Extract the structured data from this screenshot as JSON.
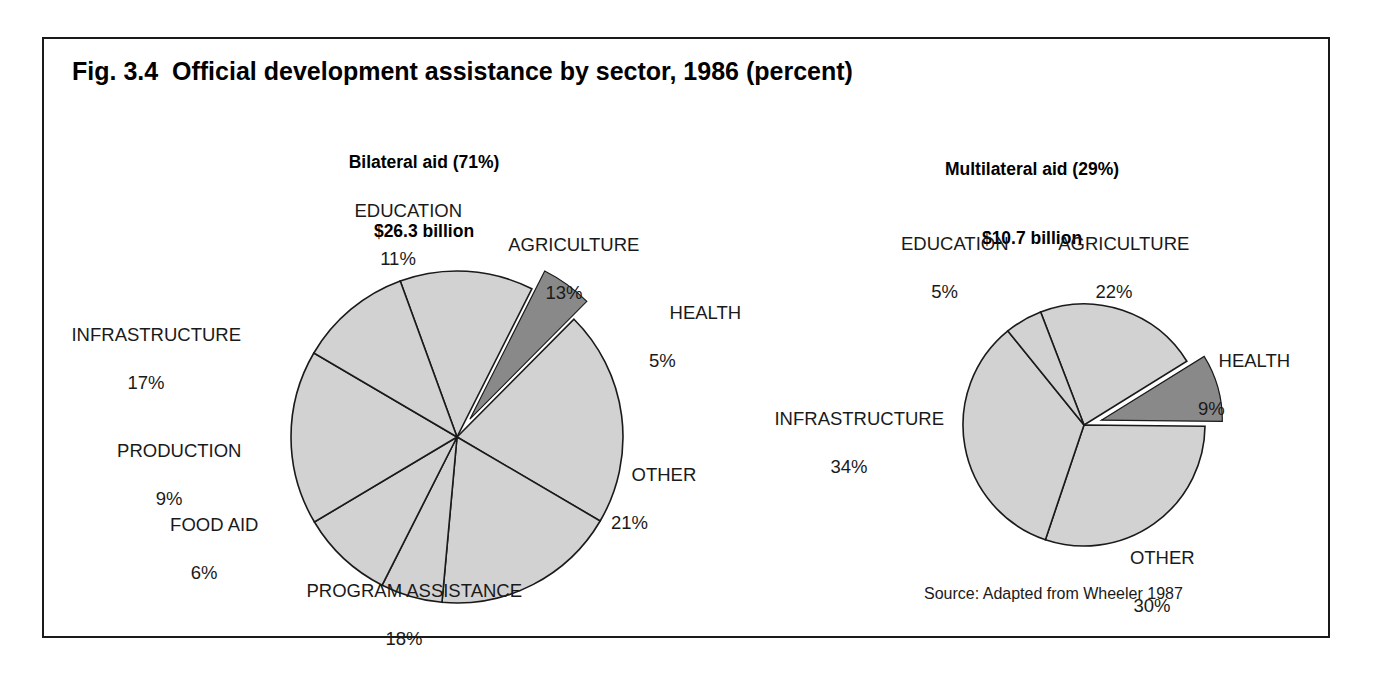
{
  "figure": {
    "title": "Fig. 3.4  Official development assistance by sector, 1986 (percent)",
    "source": "Source: Adapted from Wheeler 1987",
    "frame_color": "#1a1a1a",
    "background": "#ffffff"
  },
  "style": {
    "slice_fill": "#d2d2d2",
    "highlight_fill": "#898989",
    "slice_stroke": "#1a1a1a"
  },
  "chart_data": [
    {
      "type": "pie",
      "id": "bilateral",
      "title": "Bilateral aid (71%)",
      "subtitle": "$26.3 billion",
      "total_label": "$26.3 billion",
      "share_of_total_pct": 71,
      "total_usd_billion": 26.3,
      "unit": "percent",
      "categories": [
        "AGRICULTURE",
        "HEALTH",
        "OTHER",
        "PROGRAM ASSISTANCE",
        "FOOD AID",
        "PRODUCTION",
        "INFRASTRUCTURE",
        "EDUCATION"
      ],
      "values": [
        13,
        5,
        21,
        18,
        6,
        9,
        17,
        11
      ],
      "exploded": [
        "HEALTH"
      ],
      "labels": [
        {
          "name": "EDUCATION",
          "pct": "11%",
          "value": 11
        },
        {
          "name": "AGRICULTURE",
          "pct": "13%",
          "value": 13
        },
        {
          "name": "HEALTH",
          "pct": "5%",
          "value": 5
        },
        {
          "name": "OTHER",
          "pct": "21%",
          "value": 21
        },
        {
          "name": "PROGRAM ASSISTANCE",
          "pct": "18%",
          "value": 18
        },
        {
          "name": "FOOD AID",
          "pct": "6%",
          "value": 6
        },
        {
          "name": "PRODUCTION",
          "pct": "9%",
          "value": 9
        },
        {
          "name": "INFRASTRUCTURE",
          "pct": "17%",
          "value": 17
        }
      ],
      "geometry": {
        "cx": 213,
        "cy": 213,
        "r": 166,
        "start_angle_deg": -20,
        "explode_offset": 22
      }
    },
    {
      "type": "pie",
      "id": "multilateral",
      "title": "Multilateral aid (29%)",
      "subtitle": "$10.7 billion",
      "total_label": "$10.7 billion",
      "share_of_total_pct": 29,
      "total_usd_billion": 10.7,
      "unit": "percent",
      "categories": [
        "AGRICULTURE",
        "HEALTH",
        "OTHER",
        "INFRASTRUCTURE",
        "EDUCATION"
      ],
      "values": [
        22,
        9,
        30,
        34,
        5
      ],
      "exploded": [
        "HEALTH"
      ],
      "labels": [
        {
          "name": "EDUCATION",
          "pct": "5%",
          "value": 5
        },
        {
          "name": "AGRICULTURE",
          "pct": "22%",
          "value": 22
        },
        {
          "name": "HEALTH",
          "pct": "9%",
          "value": 9
        },
        {
          "name": "OTHER",
          "pct": "30%",
          "value": 30
        },
        {
          "name": "INFRASTRUCTURE",
          "pct": "34%",
          "value": 34
        }
      ],
      "geometry": {
        "cx": 170,
        "cy": 161,
        "r": 121,
        "start_angle_deg": -21,
        "explode_offset": 18
      }
    }
  ],
  "left_labels": {
    "education": {
      "name": "EDUCATION",
      "pct": "11%"
    },
    "agriculture": {
      "name": "AGRICULTURE",
      "pct": "13%"
    },
    "health": {
      "name": "HEALTH",
      "pct": "5%"
    },
    "other": {
      "name": "OTHER",
      "pct": "21%"
    },
    "program": {
      "name": "PROGRAM ASSISTANCE",
      "pct": "18%"
    },
    "food_aid": {
      "name": "FOOD AID",
      "pct": "6%"
    },
    "production": {
      "name": "PRODUCTION",
      "pct": "9%"
    },
    "infrastructure": {
      "name": "INFRASTRUCTURE",
      "pct": "17%"
    }
  },
  "right_labels": {
    "education": {
      "name": "EDUCATION",
      "pct": "5%"
    },
    "agriculture": {
      "name": "AGRICULTURE",
      "pct": "22%"
    },
    "health": {
      "name": "HEALTH",
      "pct": "9%"
    },
    "other": {
      "name": "OTHER",
      "pct": "30%"
    },
    "infrastructure": {
      "name": "INFRASTRUCTURE",
      "pct": "34%"
    }
  }
}
